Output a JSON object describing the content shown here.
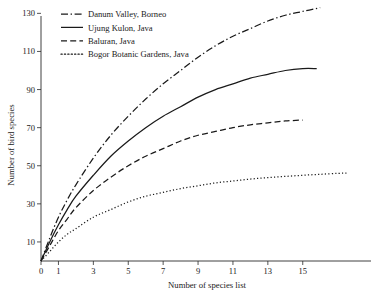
{
  "chart_data": {
    "type": "line",
    "title": "",
    "xlabel": "Number of species list",
    "ylabel": "Number of bird species",
    "xlim": [
      0,
      17.8
    ],
    "ylim": [
      0,
      138
    ],
    "xticks": [
      0,
      1,
      3,
      5,
      7,
      9,
      11,
      13,
      15
    ],
    "yticks": [
      10,
      30,
      50,
      70,
      90,
      110,
      130
    ],
    "grid": false,
    "legend_position": "top-left",
    "series": [
      {
        "name": "Danum Valley, Borneo",
        "linestyle": "dash-dot",
        "color": "#1a1a1a",
        "x": [
          0,
          0.5,
          1,
          1.5,
          2,
          3,
          4,
          5,
          6,
          7,
          8,
          9,
          10,
          11,
          12,
          13,
          14,
          15,
          16
        ],
        "y": [
          0,
          12,
          23,
          32,
          40,
          54,
          66,
          76,
          85,
          93,
          100,
          107,
          113,
          118,
          122,
          126,
          129,
          131,
          133
        ]
      },
      {
        "name": "Ujung Kulon, Java",
        "linestyle": "solid",
        "color": "#1a1a1a",
        "x": [
          0,
          0.5,
          1,
          1.5,
          2,
          3,
          4,
          5,
          6,
          7,
          8,
          9,
          10,
          11,
          12,
          13,
          14,
          15,
          15.8
        ],
        "y": [
          0,
          10,
          19,
          27,
          34,
          45,
          55,
          63,
          70,
          76,
          81,
          86,
          90,
          93,
          96,
          98,
          100,
          101,
          101
        ]
      },
      {
        "name": "Baluran, Java",
        "linestyle": "dashed",
        "color": "#1a1a1a",
        "x": [
          0,
          0.5,
          1,
          1.5,
          2,
          3,
          4,
          5,
          6,
          7,
          8,
          9,
          10,
          11,
          12,
          13,
          14,
          15
        ],
        "y": [
          0,
          8,
          16,
          22,
          28,
          37,
          44,
          50,
          55,
          59,
          63,
          66,
          68,
          70,
          71.5,
          72.5,
          73.5,
          74
        ]
      },
      {
        "name": "Bogor Botanic Gardens, Java",
        "linestyle": "dotted",
        "color": "#1a1a1a",
        "x": [
          0,
          0.5,
          1,
          1.5,
          2,
          3,
          4,
          5,
          6,
          7,
          8,
          9,
          10,
          11,
          12,
          13,
          14,
          15,
          16,
          17,
          17.6
        ],
        "y": [
          0,
          5,
          10,
          14,
          17,
          23,
          27,
          31,
          34,
          36,
          38,
          39.5,
          41,
          42,
          43,
          43.8,
          44.4,
          45,
          45.5,
          46,
          46.2
        ]
      }
    ]
  },
  "legend": {
    "items": [
      {
        "label": "Danum Valley, Borneo",
        "style": "dash-dot"
      },
      {
        "label": "Ujung Kulon, Java",
        "style": "solid"
      },
      {
        "label": "Baluran, Java",
        "style": "dashed"
      },
      {
        "label": "Bogor Botanic Gardens, Java",
        "style": "dotted"
      }
    ]
  },
  "axes": {
    "x_title": "Number of species list",
    "y_title": "Number of bird species",
    "x_tick_labels": [
      "0",
      "1",
      "3",
      "5",
      "7",
      "9",
      "11",
      "13",
      "15"
    ],
    "y_tick_labels": [
      "10",
      "30",
      "50",
      "70",
      "90",
      "110",
      "130"
    ]
  }
}
